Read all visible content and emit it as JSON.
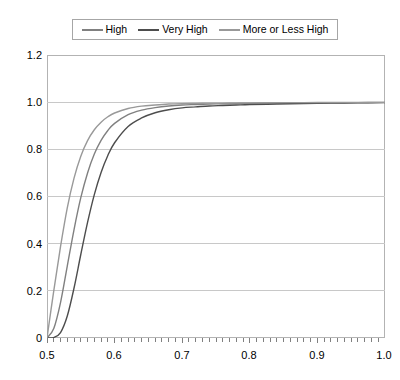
{
  "chart_data": {
    "type": "line",
    "title": "",
    "xlabel": "",
    "ylabel": "",
    "xlim": [
      0.5,
      1.0
    ],
    "ylim": [
      0.0,
      1.2
    ],
    "grid": true,
    "legend_position": "top",
    "x_ticks": [
      "0.5",
      "0.6",
      "0.7",
      "0.8",
      "0.9",
      "1.0"
    ],
    "x_tick_values": [
      0.5,
      0.6,
      0.7,
      0.8,
      0.9,
      1.0
    ],
    "x_minor_tick_step": 0.01,
    "y_ticks": [
      "0",
      "0.2",
      "0.4",
      "0.6",
      "0.8",
      "1.0",
      "1.2"
    ],
    "y_tick_values": [
      0,
      0.2,
      0.4,
      0.6,
      0.8,
      1.0,
      1.2
    ],
    "series": [
      {
        "name": "High",
        "color": "#808080",
        "x": [
          0.5,
          0.51,
          0.52,
          0.53,
          0.54,
          0.55,
          0.56,
          0.57,
          0.58,
          0.59,
          0.6,
          0.62,
          0.64,
          0.66,
          0.68,
          0.7,
          0.72,
          0.74,
          0.76,
          0.78,
          0.8,
          0.84,
          0.88,
          0.92,
          0.96,
          1.0
        ],
        "values": [
          0.0,
          0.04,
          0.15,
          0.305,
          0.46,
          0.595,
          0.7,
          0.78,
          0.838,
          0.88,
          0.91,
          0.947,
          0.966,
          0.977,
          0.984,
          0.988,
          0.99,
          0.992,
          0.993,
          0.994,
          0.995,
          0.996,
          0.997,
          0.998,
          0.998,
          0.999
        ]
      },
      {
        "name": "Very High",
        "color": "#4d4d4d",
        "x": [
          0.5,
          0.51,
          0.52,
          0.53,
          0.54,
          0.55,
          0.56,
          0.57,
          0.58,
          0.59,
          0.6,
          0.62,
          0.64,
          0.66,
          0.68,
          0.7,
          0.72,
          0.74,
          0.76,
          0.78,
          0.8,
          0.84,
          0.88,
          0.92,
          0.96,
          1.0
        ],
        "values": [
          0.0,
          0.002,
          0.023,
          0.093,
          0.212,
          0.354,
          0.49,
          0.608,
          0.702,
          0.774,
          0.828,
          0.897,
          0.933,
          0.955,
          0.968,
          0.976,
          0.98,
          0.984,
          0.986,
          0.988,
          0.99,
          0.992,
          0.994,
          0.996,
          0.997,
          0.998
        ]
      },
      {
        "name": "More or Less High",
        "color": "#999999",
        "x": [
          0.5,
          0.51,
          0.52,
          0.53,
          0.54,
          0.55,
          0.56,
          0.57,
          0.58,
          0.59,
          0.6,
          0.62,
          0.64,
          0.66,
          0.68,
          0.7,
          0.72,
          0.74,
          0.76,
          0.78,
          0.8,
          0.84,
          0.88,
          0.92,
          0.96,
          1.0
        ],
        "values": [
          0.0,
          0.2,
          0.387,
          0.552,
          0.678,
          0.771,
          0.837,
          0.883,
          0.915,
          0.938,
          0.954,
          0.973,
          0.983,
          0.988,
          0.992,
          0.994,
          0.995,
          0.996,
          0.996,
          0.997,
          0.997,
          0.998,
          0.998,
          0.999,
          0.999,
          0.999
        ]
      }
    ]
  },
  "legend": {
    "entries": [
      {
        "label": "High",
        "color": "#808080"
      },
      {
        "label": "Very High",
        "color": "#4d4d4d"
      },
      {
        "label": "More or Less High",
        "color": "#999999"
      }
    ]
  },
  "axes": {
    "y_labels": [
      "1.2",
      "1.0",
      "0.8",
      "0.6",
      "0.4",
      "0.2",
      "0"
    ],
    "x_labels": [
      "0.5",
      "0.6",
      "0.7",
      "0.8",
      "0.9",
      "1.0"
    ]
  },
  "style": {
    "grid_color": "#c8c8c8",
    "frame_color": "#b3b3b3",
    "background": "#ffffff",
    "text_color": "#000000"
  }
}
